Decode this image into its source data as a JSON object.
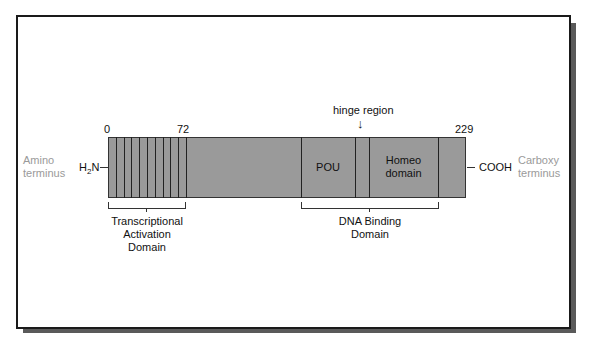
{
  "diagram": {
    "amino_terminus": "Amino terminus",
    "amino_line1": "Amino",
    "amino_line2": "terminus",
    "carboxy_line1": "Carboxy",
    "carboxy_line2": "terminus",
    "n_end_label": "H",
    "n_end_sub": "2",
    "n_end_suffix": "N",
    "c_end_label": "COOH",
    "position_start": "0",
    "position_72": "72",
    "position_end": "229",
    "hinge_label": "hinge region",
    "hinge_arrow": "↓",
    "domains": {
      "pou": "POU",
      "homeo_line1": "Homeo",
      "homeo_line2": "domain"
    },
    "brackets": {
      "activation_line1": "Transcriptional",
      "activation_line2": "Activation",
      "activation_line3": "Domain",
      "dna_line1": "DNA Binding",
      "dna_line2": "Domain"
    },
    "colors": {
      "bar_fill": "#9a9a9a",
      "terminus_text": "#9a9a9a",
      "shadow": "#5a5a5a"
    }
  }
}
